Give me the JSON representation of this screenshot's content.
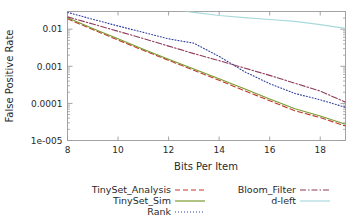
{
  "chart_data": {
    "type": "line",
    "title": "",
    "xlabel": "Bits Per Item",
    "ylabel": "False Positive Rate",
    "xlim": [
      8,
      19
    ],
    "ylim": [
      1e-05,
      0.03
    ],
    "yscale": "log",
    "grid": false,
    "legend_position": "bottom",
    "xticks": [
      8,
      10,
      12,
      14,
      16,
      18
    ],
    "xtick_labels": [
      "8",
      "10",
      "12",
      "14",
      "16",
      "18"
    ],
    "yticks": [
      0.01,
      0.001,
      0.0001,
      1e-05
    ],
    "ytick_labels": [
      "0.01",
      "0.001",
      "0.0001",
      "1e-005"
    ],
    "x": [
      8,
      9,
      10,
      11,
      12,
      13,
      14,
      15,
      16,
      17,
      18,
      19
    ],
    "series": [
      {
        "name": "TinySet_Analysis",
        "color": "#c0392b",
        "style": "dashed",
        "x": [
          8,
          9,
          10,
          11,
          12,
          13,
          14,
          15,
          16,
          17,
          18,
          19
        ],
        "values": [
          0.019,
          0.0098,
          0.0051,
          0.0027,
          0.00145,
          0.00078,
          0.00042,
          0.00022,
          0.000118,
          6.3e-05,
          4.15e-05,
          2.45e-05
        ]
      },
      {
        "name": "TinySet_Sim",
        "color": "#7a9a2e",
        "style": "solid",
        "x": [
          8,
          9,
          10,
          11,
          12,
          13,
          14,
          15,
          16,
          17,
          18,
          19
        ],
        "values": [
          0.0205,
          0.0105,
          0.0055,
          0.0029,
          0.00155,
          0.00084,
          0.00046,
          0.00025,
          0.000132,
          7.2e-05,
          4.55e-05,
          2.75e-05
        ]
      },
      {
        "name": "Rank",
        "color": "#303f9f",
        "style": "dotted",
        "x": [
          8,
          9,
          10,
          11,
          12,
          13,
          14,
          15,
          16,
          17,
          18,
          19
        ],
        "values": [
          0.0285,
          0.0185,
          0.0122,
          0.0082,
          0.0055,
          0.0042,
          0.00185,
          0.00072,
          0.00034,
          0.000185,
          0.000125,
          7.85e-05
        ]
      },
      {
        "name": "Bloom_Filter",
        "color": "#8e3b5a",
        "style": "dashdot",
        "x": [
          8,
          9,
          10,
          11,
          12,
          13,
          14,
          15,
          16,
          17,
          18,
          19
        ],
        "values": [
          0.0215,
          0.0138,
          0.0088,
          0.0056,
          0.0035,
          0.0022,
          0.00142,
          0.0009,
          0.00057,
          0.00035,
          0.000215,
          0.000108
        ]
      },
      {
        "name": "d-left",
        "color": "#a8dadc",
        "style": "solid",
        "x": [
          12.6,
          13,
          14,
          15,
          16,
          17,
          18,
          19
        ],
        "values": [
          0.031,
          0.0285,
          0.0235,
          0.0205,
          0.0183,
          0.0163,
          0.0133,
          0.0105
        ]
      }
    ]
  },
  "axes": {
    "y_title": "False Positive Rate",
    "x_title": "Bits Per Item"
  },
  "legend": {
    "entries": [
      {
        "label": "TinySet_Analysis",
        "color": "#c0392b",
        "style": "dashed"
      },
      {
        "label": "TinySet_Sim",
        "color": "#7a9a2e",
        "style": "solid"
      },
      {
        "label": "Rank",
        "color": "#303f9f",
        "style": "dotted"
      },
      {
        "label": "Bloom_Filter",
        "color": "#8e3b5a",
        "style": "dashdot"
      },
      {
        "label": "d-left",
        "color": "#a8dadc",
        "style": "solid"
      }
    ]
  },
  "colors": {
    "axis": "#9a9a9a",
    "text": "#2a2a2a",
    "background": "#ffffff"
  }
}
